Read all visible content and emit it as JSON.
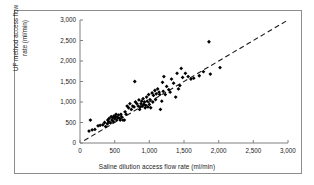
{
  "chart_data": {
    "type": "scatter",
    "title": "",
    "xlabel": "Saline dilution access  flow rate (ml/min)",
    "ylabel_line1": "UF method access flow",
    "ylabel_line2": "rate (ml/min)",
    "xlim": [
      0,
      3000
    ],
    "ylim": [
      0,
      3000
    ],
    "xticks": [
      0,
      500,
      1000,
      1500,
      2000,
      2500,
      3000
    ],
    "yticks": [
      0,
      500,
      1000,
      1500,
      2000,
      2500,
      3000
    ],
    "xticklabels": [
      "0",
      "500",
      "1,000",
      "1,500",
      "2,000",
      "2,500",
      "3,000"
    ],
    "yticklabels": [
      "0",
      "500",
      "1,000",
      "1,500",
      "2,000",
      "2,500",
      "3,000"
    ],
    "grid": false,
    "legend": false,
    "marker": "diamond",
    "marker_color": "#000000",
    "axis_color": "#808080",
    "reference_line": {
      "name": "line-of-identity",
      "style": "dashed",
      "color": "#1a1a1a",
      "x": [
        60,
        3000
      ],
      "y": [
        60,
        3000
      ]
    },
    "points": [
      {
        "x": 130,
        "y": 290
      },
      {
        "x": 150,
        "y": 560
      },
      {
        "x": 175,
        "y": 320
      },
      {
        "x": 215,
        "y": 330
      },
      {
        "x": 260,
        "y": 420
      },
      {
        "x": 290,
        "y": 430
      },
      {
        "x": 330,
        "y": 445
      },
      {
        "x": 355,
        "y": 500
      },
      {
        "x": 370,
        "y": 400
      },
      {
        "x": 395,
        "y": 470
      },
      {
        "x": 400,
        "y": 560
      },
      {
        "x": 415,
        "y": 520
      },
      {
        "x": 420,
        "y": 600
      },
      {
        "x": 440,
        "y": 490
      },
      {
        "x": 450,
        "y": 640
      },
      {
        "x": 460,
        "y": 560
      },
      {
        "x": 470,
        "y": 620
      },
      {
        "x": 480,
        "y": 520
      },
      {
        "x": 490,
        "y": 660
      },
      {
        "x": 500,
        "y": 590
      },
      {
        "x": 510,
        "y": 640
      },
      {
        "x": 520,
        "y": 700
      },
      {
        "x": 530,
        "y": 560
      },
      {
        "x": 540,
        "y": 620
      },
      {
        "x": 555,
        "y": 680
      },
      {
        "x": 570,
        "y": 600
      },
      {
        "x": 580,
        "y": 560
      },
      {
        "x": 590,
        "y": 700
      },
      {
        "x": 600,
        "y": 640
      },
      {
        "x": 620,
        "y": 560
      },
      {
        "x": 640,
        "y": 560
      },
      {
        "x": 650,
        "y": 760
      },
      {
        "x": 665,
        "y": 700
      },
      {
        "x": 680,
        "y": 900
      },
      {
        "x": 700,
        "y": 860
      },
      {
        "x": 720,
        "y": 960
      },
      {
        "x": 740,
        "y": 820
      },
      {
        "x": 760,
        "y": 900
      },
      {
        "x": 780,
        "y": 880
      },
      {
        "x": 790,
        "y": 1500
      },
      {
        "x": 800,
        "y": 1000
      },
      {
        "x": 820,
        "y": 960
      },
      {
        "x": 840,
        "y": 900
      },
      {
        "x": 850,
        "y": 1050
      },
      {
        "x": 860,
        "y": 820
      },
      {
        "x": 870,
        "y": 880
      },
      {
        "x": 880,
        "y": 960
      },
      {
        "x": 890,
        "y": 1020
      },
      {
        "x": 900,
        "y": 900
      },
      {
        "x": 910,
        "y": 1080
      },
      {
        "x": 920,
        "y": 940
      },
      {
        "x": 930,
        "y": 1000
      },
      {
        "x": 940,
        "y": 860
      },
      {
        "x": 950,
        "y": 920
      },
      {
        "x": 960,
        "y": 1120
      },
      {
        "x": 970,
        "y": 1020
      },
      {
        "x": 980,
        "y": 880
      },
      {
        "x": 990,
        "y": 1180
      },
      {
        "x": 1000,
        "y": 940
      },
      {
        "x": 1010,
        "y": 1060
      },
      {
        "x": 1020,
        "y": 860
      },
      {
        "x": 1040,
        "y": 1220
      },
      {
        "x": 1050,
        "y": 1000
      },
      {
        "x": 1060,
        "y": 1160
      },
      {
        "x": 1080,
        "y": 1280
      },
      {
        "x": 1090,
        "y": 1060
      },
      {
        "x": 1100,
        "y": 1200
      },
      {
        "x": 1120,
        "y": 1320
      },
      {
        "x": 1140,
        "y": 1240
      },
      {
        "x": 1150,
        "y": 1180
      },
      {
        "x": 1160,
        "y": 820
      },
      {
        "x": 1180,
        "y": 1020
      },
      {
        "x": 1190,
        "y": 1480
      },
      {
        "x": 1200,
        "y": 1260
      },
      {
        "x": 1210,
        "y": 1620
      },
      {
        "x": 1230,
        "y": 1180
      },
      {
        "x": 1250,
        "y": 1380
      },
      {
        "x": 1280,
        "y": 1300
      },
      {
        "x": 1300,
        "y": 1240
      },
      {
        "x": 1320,
        "y": 1560
      },
      {
        "x": 1350,
        "y": 1460
      },
      {
        "x": 1380,
        "y": 1120
      },
      {
        "x": 1400,
        "y": 1700
      },
      {
        "x": 1420,
        "y": 1320
      },
      {
        "x": 1440,
        "y": 1400
      },
      {
        "x": 1460,
        "y": 1820
      },
      {
        "x": 1480,
        "y": 1600
      },
      {
        "x": 1520,
        "y": 1700
      },
      {
        "x": 1560,
        "y": 1620
      },
      {
        "x": 1600,
        "y": 1560
      },
      {
        "x": 1640,
        "y": 1580
      },
      {
        "x": 1720,
        "y": 1640
      },
      {
        "x": 1780,
        "y": 1740
      },
      {
        "x": 1860,
        "y": 2470
      },
      {
        "x": 1880,
        "y": 1680
      },
      {
        "x": 2020,
        "y": 1840
      }
    ]
  }
}
